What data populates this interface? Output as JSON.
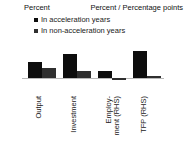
{
  "chart_data": {
    "type": "bar",
    "title": "",
    "categories": [
      "Output",
      "Investment",
      "Employ-\nment (RHS)",
      "TFP (RHS)"
    ],
    "category_labels": [
      {
        "line1": "Output",
        "line2": ""
      },
      {
        "line1": "Investment",
        "line2": ""
      },
      {
        "line1": "Employ-",
        "line2": "ment (RHS)"
      },
      {
        "line1": "TFP (RHS)",
        "line2": ""
      }
    ],
    "series": [
      {
        "name": "In acceleration years",
        "color": "#0d0d0d",
        "values": [
          5.0,
          7.5,
          2.2,
          8.5
        ],
        "axis": [
          "left",
          "left",
          "right",
          "right"
        ],
        "rhs_values": [
          null,
          null,
          0.45,
          1.7
        ]
      },
      {
        "name": "In non-acceleration years",
        "color": "#2f2f2f",
        "values": [
          3.2,
          2.2,
          -0.5,
          0.6
        ],
        "axis": [
          "left",
          "left",
          "right",
          "right"
        ],
        "rhs_values": [
          null,
          null,
          -0.1,
          0.12
        ]
      }
    ],
    "left_axis": {
      "label": "Percent",
      "ticks": [
        "20",
        "15",
        "10",
        "5",
        "0",
        "-5"
      ],
      "tick_values": [
        20,
        15,
        10,
        5,
        0,
        -5
      ],
      "ylim": [
        -5,
        20
      ]
    },
    "right_axis": {
      "label": "Percent / Percentage points",
      "ticks": [
        "4",
        "3",
        "2",
        "1",
        "0",
        "-1"
      ],
      "tick_values": [
        4,
        3,
        2,
        1,
        0,
        -1
      ],
      "ylim": [
        -1,
        4
      ]
    },
    "legend": {
      "position": "top-left-inside",
      "entries": [
        {
          "label": "In acceleration years",
          "color": "#0d0d0d"
        },
        {
          "label": "In non-acceleration years",
          "color": "#2f2f2f"
        }
      ]
    },
    "grid": false,
    "zero_line_color": "#b9b9b9"
  },
  "axes": {
    "left_title": "Percent",
    "right_title": "Percent / Percentage points"
  },
  "ticks": {
    "left": [
      "20",
      "15",
      "10",
      "5",
      "0",
      "-5"
    ],
    "right": [
      "4",
      "3",
      "2",
      "1",
      "0",
      "-1"
    ]
  },
  "legend": {
    "item0": "In acceleration years",
    "item1": "In non-acceleration years"
  },
  "categories": {
    "c0_l1": "Output",
    "c0_l2": "",
    "c1_l1": "Investment",
    "c1_l2": "",
    "c2_l1": "Employ-",
    "c2_l2": "ment (RHS)",
    "c3_l1": "TFP (RHS)",
    "c3_l2": ""
  }
}
